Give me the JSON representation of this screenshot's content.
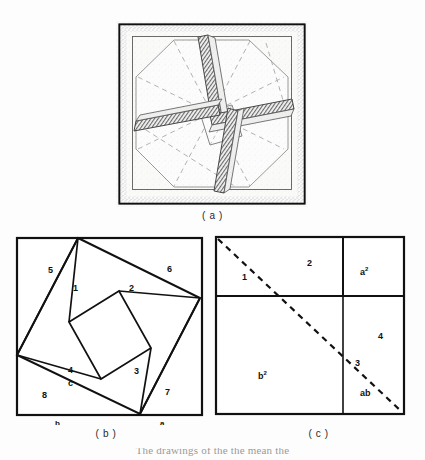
{
  "figure": {
    "domain": "Diagram",
    "kind": "scanned-book-figure",
    "panels": [
      {
        "id": "a",
        "caption": "( a )",
        "type": "photograph-of-model",
        "description": "Hsuan-thu dissection model: outer square frame with four hatched rectangular bars pinwheeled around a small central square, with dashed construction lines"
      },
      {
        "id": "b",
        "caption": "( b )",
        "type": "line-diagram"
      },
      {
        "id": "c",
        "caption": "( c )",
        "type": "line-diagram"
      }
    ],
    "running_text_top": "",
    "running_text_bottom": "The drawings of the  the  mean  the"
  },
  "panel_a": {
    "caption": "( a )",
    "outer_frame": {
      "x": 3,
      "y": 3,
      "w": 186,
      "h": 180
    },
    "inner_frame": {
      "x": 16,
      "y": 15,
      "w": 160,
      "h": 156
    },
    "bar_count": 4,
    "central_square": true,
    "dashed_lines": true
  },
  "panel_b": {
    "caption": "( b )",
    "square": {
      "x": 7,
      "y": 8,
      "w": 185,
      "h": 177
    },
    "vertices": {
      "top": [
        68,
        8
      ],
      "right": [
        190,
        68
      ],
      "bottom": [
        130,
        184
      ],
      "left": [
        7,
        125
      ]
    },
    "region_labels": [
      {
        "text": "5",
        "x": 38,
        "y": 40
      },
      {
        "text": "1",
        "x": 63,
        "y": 58
      },
      {
        "text": "2",
        "x": 119,
        "y": 58
      },
      {
        "text": "6",
        "x": 157,
        "y": 39
      },
      {
        "text": "4",
        "x": 58,
        "y": 140
      },
      {
        "text": "3",
        "x": 124,
        "y": 141
      },
      {
        "text": "7",
        "x": 155,
        "y": 162
      },
      {
        "text": "8",
        "x": 32,
        "y": 165
      }
    ],
    "side_labels": [
      {
        "text": "c",
        "x": 58,
        "y": 153
      },
      {
        "text": "b",
        "x": 45,
        "y": 193
      },
      {
        "text": "a",
        "x": 150,
        "y": 193
      }
    ]
  },
  "panel_c": {
    "caption": "( c )",
    "square": {
      "x": 4,
      "y": 7,
      "w": 188,
      "h": 177
    },
    "divider_intersection": [
      131,
      66
    ],
    "dashed_diagonal": {
      "from": [
        4,
        7
      ],
      "to": [
        192,
        184
      ]
    },
    "region_labels": [
      {
        "text": "1",
        "x": 30,
        "y": 47
      },
      {
        "text": "2",
        "x": 95,
        "y": 33
      },
      {
        "text": "3",
        "x": 143,
        "y": 133
      },
      {
        "text": "4",
        "x": 166,
        "y": 106
      }
    ],
    "area_labels": [
      {
        "text": "a",
        "sup": "2",
        "x": 148,
        "y": 42
      },
      {
        "text": "b",
        "sup": "2",
        "x": 46,
        "y": 146
      },
      {
        "text": "ab",
        "sup": "",
        "x": 148,
        "y": 163
      }
    ]
  }
}
